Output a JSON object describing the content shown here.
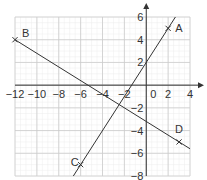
{
  "chart_data": {
    "type": "line",
    "title": "",
    "xlabel": "",
    "ylabel": "",
    "xlim": [
      -12,
      4
    ],
    "ylim": [
      -8,
      6
    ],
    "grid": true,
    "minor_grid": true,
    "x_ticks": [
      -12,
      -10,
      -8,
      -6,
      -4,
      -2,
      0,
      2,
      4
    ],
    "x_tick_labels": [
      "−12",
      "−10",
      "−8",
      "−6",
      "−4",
      "−2",
      "0",
      "2",
      "4"
    ],
    "y_ticks": [
      6,
      4,
      2,
      -2,
      -4,
      -6,
      -8
    ],
    "y_tick_labels": [
      "6",
      "4",
      "2",
      "−2",
      "−4",
      "−6",
      "−8"
    ],
    "points": [
      {
        "label": "A",
        "x": 2,
        "y": 5
      },
      {
        "label": "B",
        "x": -12,
        "y": 4
      },
      {
        "label": "C",
        "x": -6,
        "y": -7
      },
      {
        "label": "D",
        "x": 3,
        "y": -5
      }
    ],
    "series": [
      {
        "name": "Line AC",
        "through": [
          "A",
          "C"
        ],
        "x": [
          -6.667,
          2.667
        ],
        "y": [
          -8,
          6
        ]
      },
      {
        "name": "Line BD",
        "through": [
          "B",
          "D"
        ],
        "x": [
          -12,
          4
        ],
        "y": [
          4,
          -5.6
        ]
      }
    ],
    "line_color": "#333333",
    "grid_color": "#cccccc",
    "minor_grid_color": "#ececec"
  }
}
